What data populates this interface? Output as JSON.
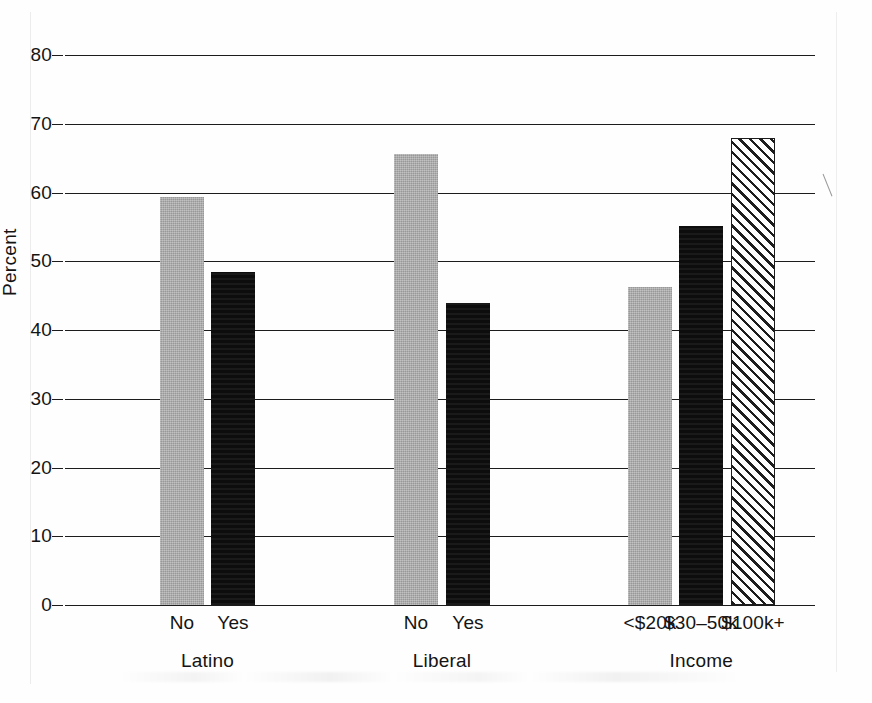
{
  "chart_data": {
    "type": "bar",
    "title": "",
    "subtitle": "",
    "xlabel": "",
    "ylabel": "Percent",
    "ylim": [
      0,
      80
    ],
    "ytick_labels": [
      "80",
      "70",
      "60",
      "50",
      "40",
      "30",
      "20",
      "10",
      "0"
    ],
    "ytick_values": [
      80,
      70,
      60,
      50,
      40,
      30,
      20,
      10,
      0
    ],
    "grid": true,
    "legend": "none",
    "groups": [
      {
        "name": "Latino",
        "bars": [
          {
            "category": "No",
            "value": 59.3,
            "style": "gray"
          },
          {
            "category": "Yes",
            "value": 48.4,
            "style": "black"
          }
        ]
      },
      {
        "name": "Liberal",
        "bars": [
          {
            "category": "No",
            "value": 65.6,
            "style": "gray"
          },
          {
            "category": "Yes",
            "value": 43.9,
            "style": "black"
          }
        ]
      },
      {
        "name": "Income",
        "bars": [
          {
            "category": "<$20k",
            "value": 46.3,
            "style": "gray"
          },
          {
            "category": "$30–50k",
            "value": 55.1,
            "style": "black"
          },
          {
            "category": "$100k+",
            "value": 67.9,
            "style": "hatch"
          }
        ]
      }
    ],
    "categories": [
      "No",
      "Yes",
      "No",
      "Yes",
      "<$20k",
      "$30–50k",
      "$100k+"
    ],
    "values": [
      59.3,
      48.4,
      65.6,
      43.9,
      46.3,
      55.1,
      67.9
    ],
    "colors": {
      "gray": "#a9a9a9",
      "black": "#0d0d0d",
      "hatch_fill": "#fdfdfd",
      "hatch_line": "#1c1c1c",
      "axis": "#1c1c1c",
      "text": "#141414",
      "background": "#fefefe"
    }
  },
  "layout": {
    "plot_left": 65,
    "plot_right": 815,
    "plot_top_y": 55,
    "plot_baseline_y": 605,
    "bar_width": 44,
    "bar_positions_px": [
      160,
      211,
      394,
      446,
      628,
      679,
      731
    ]
  }
}
